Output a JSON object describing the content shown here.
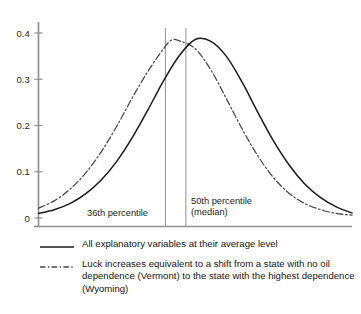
{
  "chart_data": {
    "type": "line",
    "title": "",
    "xlabel": "",
    "ylabel": "",
    "ylim": [
      0,
      0.43
    ],
    "xlim": [
      0,
      1
    ],
    "grid": false,
    "legend_position": "below-plot",
    "y_ticks": [
      "0",
      "0.1",
      "0.2",
      "0.3",
      "0.4"
    ],
    "y_tick_values": [
      0,
      0.1,
      0.2,
      0.3,
      0.4
    ],
    "x_ticks": [],
    "series": [
      {
        "name": "All explanatory variables at their average level",
        "style": "solid",
        "color": "#1a1a1a",
        "peak_x": 0.5,
        "peak_y": 0.386,
        "sigma": 0.175,
        "points": [
          {
            "x": 0.0,
            "y": 0.01
          },
          {
            "x": 0.05,
            "y": 0.018
          },
          {
            "x": 0.1,
            "y": 0.031
          },
          {
            "x": 0.15,
            "y": 0.052
          },
          {
            "x": 0.2,
            "y": 0.082
          },
          {
            "x": 0.25,
            "y": 0.123
          },
          {
            "x": 0.3,
            "y": 0.175
          },
          {
            "x": 0.35,
            "y": 0.235
          },
          {
            "x": 0.4,
            "y": 0.298
          },
          {
            "x": 0.45,
            "y": 0.352
          },
          {
            "x": 0.5,
            "y": 0.386
          },
          {
            "x": 0.55,
            "y": 0.382
          },
          {
            "x": 0.6,
            "y": 0.349
          },
          {
            "x": 0.65,
            "y": 0.293
          },
          {
            "x": 0.7,
            "y": 0.228
          },
          {
            "x": 0.75,
            "y": 0.166
          },
          {
            "x": 0.8,
            "y": 0.114
          },
          {
            "x": 0.85,
            "y": 0.073
          },
          {
            "x": 0.9,
            "y": 0.044
          },
          {
            "x": 0.95,
            "y": 0.024
          },
          {
            "x": 1.0,
            "y": 0.011
          }
        ]
      },
      {
        "name": "Luck increases equivalent to a shift from a state with no oil dependence (Vermont) to the state with the highest dependence (Wyoming)",
        "style": "dash-dot",
        "color": "#3a3a3a",
        "peak_x": 0.425,
        "peak_y": 0.385,
        "sigma": 0.172,
        "points": [
          {
            "x": 0.0,
            "y": 0.021
          },
          {
            "x": 0.05,
            "y": 0.037
          },
          {
            "x": 0.1,
            "y": 0.062
          },
          {
            "x": 0.15,
            "y": 0.097
          },
          {
            "x": 0.2,
            "y": 0.143
          },
          {
            "x": 0.25,
            "y": 0.199
          },
          {
            "x": 0.3,
            "y": 0.261
          },
          {
            "x": 0.35,
            "y": 0.318
          },
          {
            "x": 0.4,
            "y": 0.367
          },
          {
            "x": 0.425,
            "y": 0.385
          },
          {
            "x": 0.45,
            "y": 0.383
          },
          {
            "x": 0.5,
            "y": 0.366
          },
          {
            "x": 0.55,
            "y": 0.32
          },
          {
            "x": 0.6,
            "y": 0.257
          },
          {
            "x": 0.65,
            "y": 0.192
          },
          {
            "x": 0.7,
            "y": 0.134
          },
          {
            "x": 0.75,
            "y": 0.087
          },
          {
            "x": 0.8,
            "y": 0.053
          },
          {
            "x": 0.85,
            "y": 0.031
          },
          {
            "x": 0.9,
            "y": 0.018
          },
          {
            "x": 0.95,
            "y": 0.01
          },
          {
            "x": 1.0,
            "y": 0.006
          }
        ]
      }
    ],
    "reference_lines": [
      {
        "id": "p36",
        "x": 0.405,
        "label": "36th percentile",
        "label_line2": ""
      },
      {
        "id": "p50",
        "x": 0.47,
        "label": "50th percentile",
        "label_line2": "(median)"
      }
    ]
  },
  "axis": {
    "y_tick_0": "0",
    "y_tick_1": "0.1",
    "y_tick_2": "0.2",
    "y_tick_3": "0.3",
    "y_tick_4": "0.4"
  },
  "annotations": {
    "left_marker": "36th percentile",
    "right_marker_line1": "50th percentile",
    "right_marker_line2": "(median)"
  },
  "legend": {
    "entries": [
      {
        "style": "solid",
        "label": "All explanatory variables at their average level"
      },
      {
        "style": "dash-dot",
        "label": "Luck increases equivalent to a shift from a state with no oil dependence (Vermont) to the state with the highest dependence (Wyoming)"
      }
    ]
  },
  "colors": {
    "axis": "#8a8a8a",
    "solid_curve": "#1a1a1a",
    "dashed_curve": "#454545",
    "reference_line": "#9a9a9a",
    "text": "#141414",
    "background": "#ffffff"
  }
}
